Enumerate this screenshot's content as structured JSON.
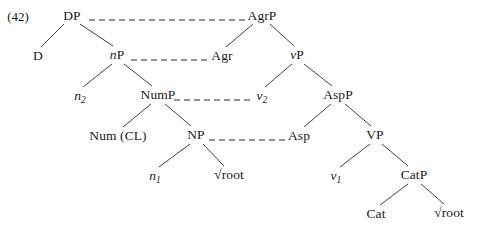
{
  "diagram": {
    "type": "syntax-tree",
    "example_number": "(42)",
    "stroke_color": "#2b2b2b",
    "text_color": "#1a1a1a",
    "background_color": "#ffffff",
    "nodes": [
      {
        "id": "DP",
        "label": "DP",
        "x": 72,
        "y": 16,
        "italic_prefix": "",
        "subscript": ""
      },
      {
        "id": "AgrP",
        "label": "AgrP",
        "x": 262,
        "y": 16,
        "italic_prefix": "",
        "subscript": ""
      },
      {
        "id": "D",
        "label": "D",
        "x": 38,
        "y": 56,
        "italic_prefix": "",
        "subscript": ""
      },
      {
        "id": "nP",
        "label": "P",
        "x": 117,
        "y": 55,
        "italic_prefix": "n",
        "subscript": ""
      },
      {
        "id": "Agr",
        "label": "Agr",
        "x": 222,
        "y": 56,
        "italic_prefix": "",
        "subscript": ""
      },
      {
        "id": "vP",
        "label": "P",
        "x": 297,
        "y": 55,
        "italic_prefix": "v",
        "subscript": ""
      },
      {
        "id": "n2",
        "label": "",
        "x": 80,
        "y": 96,
        "italic_prefix": "n",
        "subscript": "2"
      },
      {
        "id": "NumP",
        "label": "NumP",
        "x": 158,
        "y": 95,
        "italic_prefix": "",
        "subscript": ""
      },
      {
        "id": "v2",
        "label": "",
        "x": 262,
        "y": 96,
        "italic_prefix": "v",
        "subscript": "2"
      },
      {
        "id": "AspP",
        "label": "AspP",
        "x": 338,
        "y": 95,
        "italic_prefix": "",
        "subscript": ""
      },
      {
        "id": "NumCL",
        "label": "Num (CL)",
        "x": 118,
        "y": 136,
        "italic_prefix": "",
        "subscript": ""
      },
      {
        "id": "NP",
        "label": "NP",
        "x": 196,
        "y": 135,
        "italic_prefix": "",
        "subscript": ""
      },
      {
        "id": "Asp",
        "label": "Asp",
        "x": 299,
        "y": 136,
        "italic_prefix": "",
        "subscript": ""
      },
      {
        "id": "VP",
        "label": "VP",
        "x": 375,
        "y": 135,
        "italic_prefix": "",
        "subscript": ""
      },
      {
        "id": "n1",
        "label": "",
        "x": 155,
        "y": 176,
        "italic_prefix": "n",
        "subscript": "1"
      },
      {
        "id": "root1",
        "label": "√root",
        "x": 229,
        "y": 175,
        "italic_prefix": "",
        "subscript": ""
      },
      {
        "id": "v1",
        "label": "",
        "x": 336,
        "y": 176,
        "italic_prefix": "v",
        "subscript": "1"
      },
      {
        "id": "CatP",
        "label": "CatP",
        "x": 414,
        "y": 175,
        "italic_prefix": "",
        "subscript": ""
      },
      {
        "id": "Cat",
        "label": "Cat",
        "x": 376,
        "y": 214,
        "italic_prefix": "",
        "subscript": ""
      },
      {
        "id": "root2",
        "label": "√root",
        "x": 449,
        "y": 213,
        "italic_prefix": "",
        "subscript": ""
      }
    ],
    "branches": [
      {
        "from": "DP",
        "to": "D",
        "x1": 64,
        "y1": 24,
        "x2": 41,
        "y2": 47
      },
      {
        "from": "DP",
        "to": "nP",
        "x1": 80,
        "y1": 24,
        "x2": 113,
        "y2": 46
      },
      {
        "from": "nP",
        "to": "n2",
        "x1": 112,
        "y1": 64,
        "x2": 83,
        "y2": 87
      },
      {
        "from": "nP",
        "to": "NumP",
        "x1": 124,
        "y1": 64,
        "x2": 152,
        "y2": 86
      },
      {
        "from": "NumP",
        "to": "NumCL",
        "x1": 151,
        "y1": 104,
        "x2": 123,
        "y2": 127
      },
      {
        "from": "NumP",
        "to": "NP",
        "x1": 165,
        "y1": 104,
        "x2": 191,
        "y2": 126
      },
      {
        "from": "NP",
        "to": "n1",
        "x1": 190,
        "y1": 144,
        "x2": 159,
        "y2": 167
      },
      {
        "from": "NP",
        "to": "root1",
        "x1": 203,
        "y1": 144,
        "x2": 224,
        "y2": 166
      },
      {
        "from": "AgrP",
        "to": "Agr",
        "x1": 253,
        "y1": 24,
        "x2": 226,
        "y2": 47
      },
      {
        "from": "AgrP",
        "to": "vP",
        "x1": 270,
        "y1": 24,
        "x2": 294,
        "y2": 46
      },
      {
        "from": "vP",
        "to": "v2",
        "x1": 292,
        "y1": 64,
        "x2": 265,
        "y2": 87
      },
      {
        "from": "vP",
        "to": "AspP",
        "x1": 304,
        "y1": 64,
        "x2": 332,
        "y2": 86
      },
      {
        "from": "AspP",
        "to": "Asp",
        "x1": 331,
        "y1": 104,
        "x2": 304,
        "y2": 127
      },
      {
        "from": "AspP",
        "to": "VP",
        "x1": 345,
        "y1": 104,
        "x2": 371,
        "y2": 126
      },
      {
        "from": "VP",
        "to": "v1",
        "x1": 370,
        "y1": 144,
        "x2": 340,
        "y2": 167
      },
      {
        "from": "VP",
        "to": "CatP",
        "x1": 382,
        "y1": 144,
        "x2": 408,
        "y2": 166
      },
      {
        "from": "CatP",
        "to": "Cat",
        "x1": 408,
        "y1": 184,
        "x2": 380,
        "y2": 205
      },
      {
        "from": "CatP",
        "to": "root2",
        "x1": 421,
        "y1": 184,
        "x2": 444,
        "y2": 204
      }
    ],
    "dashed_links": [
      {
        "from": "DP",
        "to": "AgrP",
        "x1": 89,
        "x2": 245,
        "y": 20
      },
      {
        "from": "nP",
        "to": "Agr",
        "x1": 131,
        "x2": 210,
        "y": 60
      },
      {
        "from": "NumP",
        "to": "v2",
        "x1": 174,
        "x2": 254,
        "y": 100
      },
      {
        "from": "NP",
        "to": "Asp",
        "x1": 209,
        "x2": 288,
        "y": 140
      }
    ]
  }
}
